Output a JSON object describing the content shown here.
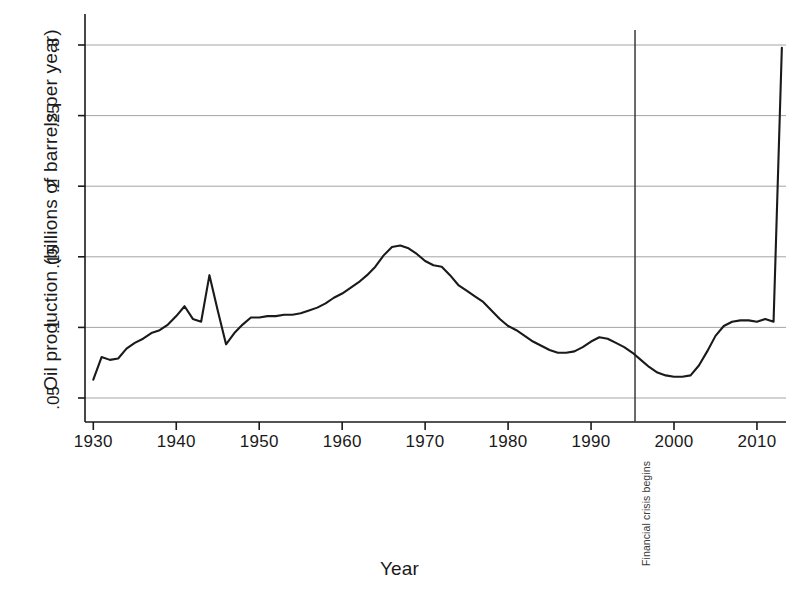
{
  "chart_data": {
    "type": "line",
    "title": "",
    "xlabel": "Year",
    "ylabel": "Oil production (billions of barrels per year)",
    "xlim": [
      1929,
      2013.5
    ],
    "ylim": [
      0.04,
      0.305
    ],
    "grid": true,
    "legend": "none",
    "xticks": [
      "1930",
      "1940",
      "1950",
      "1960",
      "1970",
      "1980",
      "1990",
      "2000",
      "2010"
    ],
    "xtick_values": [
      1930,
      1940,
      1950,
      1960,
      1970,
      1980,
      1990,
      2000,
      2010
    ],
    "yticks": [
      ".05",
      ".1",
      ".15",
      ".2",
      ".25",
      ".3"
    ],
    "ytick_values": [
      0.05,
      0.1,
      0.15,
      0.2,
      0.25,
      0.3
    ],
    "series": [
      {
        "name": "Oil production",
        "color": "#1a1a1a",
        "x": [
          1930,
          1931,
          1932,
          1933,
          1934,
          1935,
          1936,
          1937,
          1938,
          1939,
          1940,
          1941,
          1942,
          1943,
          1944,
          1945,
          1946,
          1947,
          1948,
          1949,
          1950,
          1951,
          1952,
          1953,
          1954,
          1955,
          1956,
          1957,
          1958,
          1959,
          1960,
          1961,
          1962,
          1963,
          1964,
          1965,
          1966,
          1967,
          1968,
          1969,
          1970,
          1971,
          1972,
          1973,
          1974,
          1975,
          1976,
          1977,
          1978,
          1979,
          1980,
          1981,
          1982,
          1983,
          1984,
          1985,
          1986,
          1987,
          1988,
          1989,
          1990,
          1991,
          1992,
          1993,
          1994,
          1995,
          1996,
          1997,
          1998,
          1999,
          2000,
          2001,
          2002,
          2003,
          2004,
          2005,
          2006,
          2007,
          2008,
          2009,
          2010,
          2011,
          2012,
          2013
        ],
        "y": [
          0.063,
          0.079,
          0.077,
          0.078,
          0.085,
          0.089,
          0.092,
          0.096,
          0.098,
          0.102,
          0.108,
          0.115,
          0.106,
          0.104,
          0.137,
          0.112,
          0.088,
          0.096,
          0.102,
          0.107,
          0.107,
          0.108,
          0.108,
          0.109,
          0.109,
          0.11,
          0.112,
          0.114,
          0.117,
          0.121,
          0.124,
          0.128,
          0.132,
          0.137,
          0.143,
          0.151,
          0.157,
          0.158,
          0.156,
          0.152,
          0.147,
          0.144,
          0.143,
          0.137,
          0.13,
          0.126,
          0.122,
          0.118,
          0.112,
          0.106,
          0.101,
          0.098,
          0.094,
          0.09,
          0.087,
          0.084,
          0.082,
          0.082,
          0.083,
          0.086,
          0.09,
          0.093,
          0.092,
          0.089,
          0.086,
          0.082,
          0.077,
          0.072,
          0.068,
          0.066,
          0.065,
          0.065,
          0.066,
          0.073,
          0.083,
          0.094,
          0.101,
          0.104,
          0.105,
          0.105,
          0.104,
          0.106,
          0.104,
          0.298
        ],
        "annotated_points": [
          {
            "label": "start",
            "x": 1930,
            "y": 0.063
          },
          {
            "label": "wartime spike",
            "x": 1944,
            "y": 0.137
          },
          {
            "label": "postwar trough",
            "x": 1946,
            "y": 0.088
          },
          {
            "label": "peak",
            "x": 1966,
            "y": 0.158
          },
          {
            "label": "1980s trough",
            "x": 1983,
            "y": 0.082
          },
          {
            "label": "1988 bump",
            "x": 1988,
            "y": 0.093
          },
          {
            "label": "mid-90s trough",
            "x": 1996,
            "y": 0.065
          },
          {
            "label": "pre-surge plateau",
            "x": 2004,
            "y": 0.105
          },
          {
            "label": "post-surge plateau",
            "x": 2013,
            "y": 0.298
          }
        ]
      }
    ],
    "annotations": [
      {
        "type": "vertical-line",
        "label": "Financial crisis begins",
        "x": 1995.3,
        "color": "#3a3a3a"
      }
    ]
  },
  "axis": {
    "y_title": "Oil production (billions of barrels per year)",
    "x_title": "Year"
  },
  "colors": {
    "line": "#1a1a1a",
    "grid": "#9a9a9a",
    "axis": "#1a1a1a",
    "event": "#3a3a3a",
    "background": "#ffffff"
  }
}
